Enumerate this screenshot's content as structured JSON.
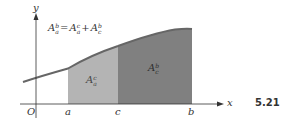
{
  "figure": {
    "number": "5.21",
    "formula": {
      "lhs": {
        "base": "A",
        "sup": "b",
        "sub": "a"
      },
      "equals": "=",
      "term1": {
        "base": "A",
        "sup": "c",
        "sub": "a"
      },
      "plus": "+",
      "term2": {
        "base": "A",
        "sup": "b",
        "sub": "c"
      }
    },
    "regions": [
      {
        "name": "left-area",
        "label": {
          "base": "A",
          "sup": "c",
          "sub": "a"
        },
        "from": "a",
        "to": "c",
        "fill": "#b4b4b4"
      },
      {
        "name": "right-area",
        "label": {
          "base": "A",
          "sup": "b",
          "sub": "c"
        },
        "from": "c",
        "to": "b",
        "fill": "#808080"
      }
    ],
    "axes": {
      "x_label": "x",
      "y_label": "y",
      "origin_label": "O"
    },
    "ticks": {
      "a": "a",
      "c": "c",
      "b": "b"
    },
    "colors": {
      "axis": "#333333",
      "curve": "#666666",
      "light_fill": "#b4b4b4",
      "dark_fill": "#808080"
    }
  }
}
